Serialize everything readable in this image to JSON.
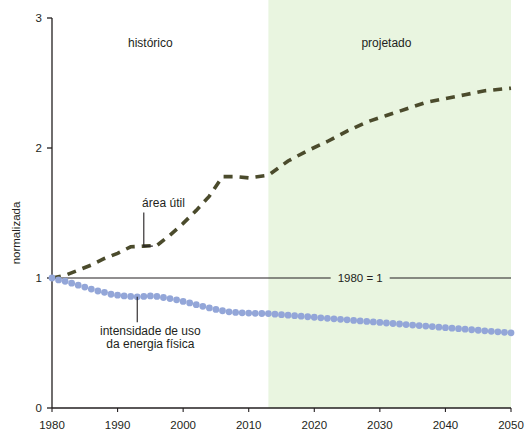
{
  "chart_data": {
    "type": "line",
    "title": "",
    "subtitle": "",
    "xlabel": "",
    "ylabel": "normalizada",
    "xlim": [
      1980,
      2050
    ],
    "ylim": [
      0,
      3
    ],
    "grid": false,
    "legend_position": "inline-annotations",
    "x_ticks": [
      1980,
      1990,
      2000,
      2010,
      2020,
      2030,
      2040,
      2050
    ],
    "x_tick_labels": [
      "1980",
      "1990",
      "2000",
      "2010",
      "2020",
      "2030",
      "2040",
      "2050"
    ],
    "y_ticks": [
      0,
      1,
      2,
      3
    ],
    "y_tick_labels": [
      "0",
      "1",
      "2",
      "3"
    ],
    "regions": [
      {
        "name": "historico",
        "label": "histórico",
        "x_start": 1980,
        "x_end": 2013,
        "fill": "#ffffff",
        "label_x": 1995,
        "label_y": 2.78
      },
      {
        "name": "projetado",
        "label": "projetado",
        "x_start": 2013,
        "x_end": 2050,
        "fill": "#e9f5e0",
        "label_x": 2031,
        "label_y": 2.78
      }
    ],
    "reference_line": {
      "label": "1980 = 1",
      "value": 1,
      "color": "#231f20",
      "label_x": 2027,
      "gap_start": 2022.5,
      "gap_end": 2031.5
    },
    "series": [
      {
        "name": "area_util",
        "label": "área útil",
        "style": "dashed",
        "color": "#4b4b2c",
        "line_width": 3.6,
        "dash_pattern": "9 7",
        "annotation": {
          "text": "área útil",
          "text_x": 1997,
          "text_y": 1.55,
          "leader_to_x": 1994,
          "leader_to_y": 1.245
        },
        "x": [
          1980,
          1982,
          1984,
          1986,
          1988,
          1990,
          1992,
          1994,
          1996,
          1998,
          2000,
          2002,
          2004,
          2006,
          2008,
          2010,
          2013,
          2016,
          2019,
          2022,
          2025,
          2028,
          2031,
          2034,
          2037,
          2040,
          2043,
          2046,
          2050
        ],
        "values": [
          1.0,
          1.02,
          1.06,
          1.1,
          1.15,
          1.19,
          1.24,
          1.245,
          1.25,
          1.33,
          1.42,
          1.52,
          1.63,
          1.78,
          1.78,
          1.77,
          1.79,
          1.9,
          1.98,
          2.05,
          2.13,
          2.2,
          2.25,
          2.3,
          2.35,
          2.38,
          2.41,
          2.44,
          2.46
        ]
      },
      {
        "name": "intensidade_uso_energia_fisica",
        "label": "intensidade de uso da energia física",
        "style": "dotted",
        "color": "#93a6d8",
        "marker_radius": 3.4,
        "annotation": {
          "text_line1": "intensidade de uso",
          "text_line2": "da energia física",
          "text_x": 1995,
          "text_y1": 0.56,
          "text_y2": 0.46,
          "leader_to_x": 1993,
          "leader_to_y": 0.855
        },
        "x": [
          1980,
          1981,
          1982,
          1983,
          1984,
          1985,
          1986,
          1987,
          1988,
          1989,
          1990,
          1991,
          1992,
          1993,
          1994,
          1995,
          1996,
          1997,
          1998,
          1999,
          2000,
          2001,
          2002,
          2003,
          2004,
          2005,
          2006,
          2007,
          2008,
          2009,
          2010,
          2011,
          2012,
          2013,
          2014,
          2015,
          2016,
          2017,
          2018,
          2019,
          2020,
          2021,
          2022,
          2023,
          2024,
          2025,
          2026,
          2027,
          2028,
          2029,
          2030,
          2031,
          2032,
          2033,
          2034,
          2035,
          2036,
          2037,
          2038,
          2039,
          2040,
          2041,
          2042,
          2043,
          2044,
          2045,
          2046,
          2047,
          2048,
          2049,
          2050
        ],
        "values": [
          1.0,
          0.985,
          0.975,
          0.96,
          0.945,
          0.93,
          0.915,
          0.9,
          0.89,
          0.875,
          0.868,
          0.862,
          0.858,
          0.855,
          0.858,
          0.862,
          0.858,
          0.85,
          0.842,
          0.832,
          0.82,
          0.808,
          0.795,
          0.782,
          0.77,
          0.758,
          0.748,
          0.74,
          0.735,
          0.732,
          0.73,
          0.728,
          0.727,
          0.726,
          0.722,
          0.718,
          0.714,
          0.71,
          0.706,
          0.702,
          0.698,
          0.694,
          0.69,
          0.686,
          0.682,
          0.678,
          0.674,
          0.67,
          0.666,
          0.662,
          0.658,
          0.654,
          0.65,
          0.646,
          0.642,
          0.638,
          0.634,
          0.63,
          0.626,
          0.622,
          0.618,
          0.614,
          0.61,
          0.606,
          0.602,
          0.598,
          0.594,
          0.59,
          0.586,
          0.582,
          0.578
        ]
      }
    ],
    "colors": {
      "area_util": "#4b4b2c",
      "intensidade": "#93a6d8",
      "projected_band": "#e9f5e0",
      "axis": "#231f20",
      "text": "#231f20"
    }
  }
}
